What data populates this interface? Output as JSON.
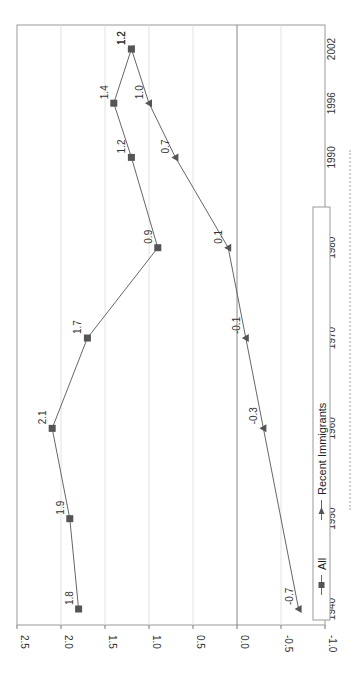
{
  "chart_data": {
    "type": "line",
    "orientation": "rotated-90-clockwise",
    "title": "",
    "xlabel": "",
    "ylabel": "",
    "x": [
      1940,
      1950,
      1960,
      1970,
      1980,
      1990,
      1996,
      2002
    ],
    "x_tick_labels": [
      "1940",
      "1950",
      "1960",
      "1970",
      "1980",
      "1990",
      "1996",
      "2002"
    ],
    "y_tick_labels": [
      "2.5",
      "2.0",
      "1.5",
      "1.0",
      "0.5",
      "0.0",
      "-0.5",
      "-1.0"
    ],
    "ylim": [
      -1.0,
      2.5
    ],
    "grid": true,
    "legend_position": "bottom",
    "series": [
      {
        "name": "All",
        "marker": "square",
        "color": "#555555",
        "x": [
          1940,
          1950,
          1960,
          1970,
          1980,
          1990,
          1996,
          2002
        ],
        "values": [
          1.8,
          1.9,
          2.1,
          1.7,
          0.9,
          1.2,
          1.4,
          1.2
        ],
        "labels": [
          "1.8",
          "1.9",
          "2.1",
          "1.7",
          "0.9",
          "1.2",
          "1.4",
          "1.2"
        ]
      },
      {
        "name": "Recent Immigrants",
        "marker": "triangle",
        "color": "#555555",
        "x": [
          1940,
          1960,
          1970,
          1980,
          1990,
          1996,
          2002
        ],
        "values": [
          -0.7,
          -0.3,
          -0.1,
          0.1,
          0.7,
          1.0,
          1.2
        ],
        "labels": [
          "-0.7",
          "-0.3",
          "-0.1",
          "0.1",
          "0.7",
          "1.0",
          "1.2"
        ]
      }
    ]
  },
  "legend": {
    "items": [
      {
        "label": "All",
        "marker": "square"
      },
      {
        "label": "Recent Immigrants",
        "marker": "triangle"
      }
    ]
  }
}
